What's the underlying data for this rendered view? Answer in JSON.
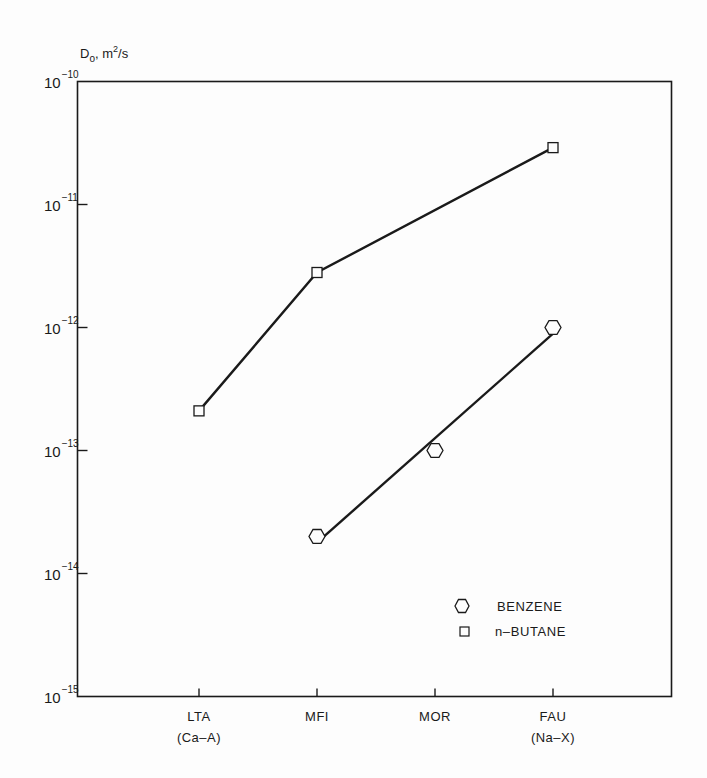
{
  "chart_data": {
    "type": "line",
    "title": "",
    "ylabel": "D₀, m²/s",
    "ylabel_parts": {
      "main": "D",
      "sub": "o",
      "rest": ", m",
      "sup": "2",
      "tail": "/s"
    },
    "xlabel": "",
    "yscale": "log",
    "ylim": [
      1e-15,
      1e-10
    ],
    "yticks": [
      {
        "value": 1e-10,
        "base": "10",
        "exp": "−10"
      },
      {
        "value": 1e-11,
        "base": "10",
        "exp": "−11"
      },
      {
        "value": 1e-12,
        "base": "10",
        "exp": "−12"
      },
      {
        "value": 1e-13,
        "base": "10",
        "exp": "−13"
      },
      {
        "value": 1e-14,
        "base": "10",
        "exp": "−14"
      },
      {
        "value": 1e-15,
        "base": "10",
        "exp": "−15"
      }
    ],
    "categories": [
      {
        "label": "LTA",
        "sublabel": "(Ca–A)"
      },
      {
        "label": "MFI",
        "sublabel": ""
      },
      {
        "label": "MOR",
        "sublabel": ""
      },
      {
        "label": "FAU",
        "sublabel": "(Na–X)"
      }
    ],
    "series": [
      {
        "name": "n–BUTANE",
        "marker": "square",
        "values": [
          2.1e-13,
          2.8e-12,
          null,
          2.9e-11
        ],
        "line": "connect"
      },
      {
        "name": "BENZENE",
        "marker": "hexagon",
        "values": [
          null,
          2e-14,
          1e-13,
          1e-12
        ],
        "line": "fit"
      }
    ],
    "grid": false,
    "legend_position": "lower right"
  },
  "legend": {
    "items": [
      {
        "label": "BENZENE",
        "marker": "hexagon"
      },
      {
        "label": "n–BUTANE",
        "marker": "square"
      }
    ]
  },
  "colors": {
    "ink": "#1a1a1a",
    "background": "#fdfdfd"
  }
}
